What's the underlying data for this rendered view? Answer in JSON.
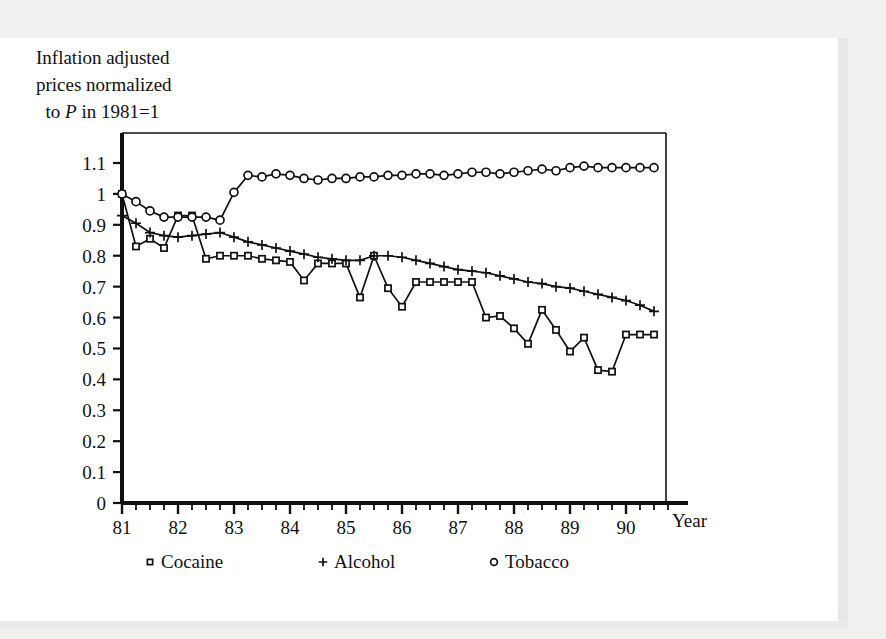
{
  "figure": {
    "caption_line1": "Inflation adjusted",
    "caption_line2": "prices normalized",
    "caption_line3_pre": "to ",
    "caption_line3_ital": "P",
    "caption_line3_post": " in 1981=1",
    "axis_name_x": "Year",
    "ink_color": "#111111",
    "paper_color": "#ffffff"
  },
  "legend": {
    "entries": [
      {
        "label": "Cocaine",
        "marker": "square"
      },
      {
        "label": "Alcohol",
        "marker": "plus"
      },
      {
        "label": "Tobacco",
        "marker": "circle"
      }
    ]
  },
  "chart_data": {
    "type": "line",
    "title": "Inflation adjusted prices normalized to P in 1981=1",
    "xlabel": "Year",
    "ylabel": "Inflation adjusted prices normalized to P in 1981=1",
    "xlim": [
      81.0,
      90.75
    ],
    "ylim": [
      0,
      1.15
    ],
    "grid": false,
    "legend_position": "below-axis",
    "x_tick_labels": [
      "81",
      "82",
      "83",
      "84",
      "85",
      "86",
      "87",
      "88",
      "89",
      "90"
    ],
    "x_tick_values": [
      81,
      82,
      83,
      84,
      85,
      86,
      87,
      88,
      89,
      90
    ],
    "x_minor_tick_step": 0.25,
    "y_tick_labels": [
      "0",
      "0.1",
      "0.2",
      "0.3",
      "0.4",
      "0.5",
      "0.6",
      "0.7",
      "0.8",
      "0.9",
      "1",
      "1.1"
    ],
    "y_tick_values": [
      0,
      0.1,
      0.2,
      0.3,
      0.4,
      0.5,
      0.6,
      0.7,
      0.8,
      0.9,
      1.0,
      1.1
    ],
    "x": [
      81.0,
      81.25,
      81.5,
      81.75,
      82.0,
      82.25,
      82.5,
      82.75,
      83.0,
      83.25,
      83.5,
      83.75,
      84.0,
      84.25,
      84.5,
      84.75,
      85.0,
      85.25,
      85.5,
      85.75,
      86.0,
      86.25,
      86.5,
      86.75,
      87.0,
      87.25,
      87.5,
      87.75,
      88.0,
      88.25,
      88.5,
      88.75,
      89.0,
      89.25,
      89.5,
      89.75,
      90.0,
      90.25,
      90.5
    ],
    "series": [
      {
        "name": "Cocaine",
        "marker": "square",
        "values": [
          1.0,
          0.83,
          0.855,
          0.825,
          0.93,
          0.93,
          0.79,
          0.8,
          0.8,
          0.8,
          0.79,
          0.785,
          0.78,
          0.72,
          0.775,
          0.775,
          0.775,
          0.665,
          0.8,
          0.695,
          0.635,
          0.715,
          0.715,
          0.715,
          0.715,
          0.715,
          0.6,
          0.605,
          0.565,
          0.515,
          0.625,
          0.56,
          0.49,
          0.535,
          0.43,
          0.425,
          0.545,
          0.545,
          0.545
        ]
      },
      {
        "name": "Alcohol",
        "marker": "plus",
        "values": [
          0.93,
          0.905,
          0.875,
          0.865,
          0.86,
          0.865,
          0.87,
          0.875,
          0.86,
          0.845,
          0.835,
          0.825,
          0.815,
          0.805,
          0.795,
          0.79,
          0.785,
          0.785,
          0.8,
          0.8,
          0.795,
          0.785,
          0.775,
          0.765,
          0.755,
          0.75,
          0.745,
          0.735,
          0.725,
          0.715,
          0.71,
          0.7,
          0.695,
          0.685,
          0.675,
          0.665,
          0.655,
          0.64,
          0.62
        ]
      },
      {
        "name": "Tobacco",
        "marker": "circle",
        "values": [
          1.0,
          0.975,
          0.945,
          0.925,
          0.925,
          0.925,
          0.925,
          0.915,
          1.005,
          1.06,
          1.055,
          1.065,
          1.06,
          1.05,
          1.045,
          1.05,
          1.05,
          1.055,
          1.055,
          1.06,
          1.06,
          1.065,
          1.065,
          1.06,
          1.065,
          1.07,
          1.07,
          1.065,
          1.07,
          1.075,
          1.08,
          1.075,
          1.085,
          1.09,
          1.085,
          1.085,
          1.085,
          1.085,
          1.085
        ]
      }
    ]
  }
}
